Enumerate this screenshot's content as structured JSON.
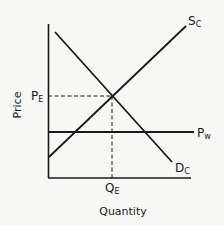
{
  "diagram": {
    "type": "supply-demand",
    "y_axis_label": "Price",
    "x_axis_label": "Quantity",
    "labels": {
      "supply": {
        "main": "S",
        "sub": "C"
      },
      "demand": {
        "main": "D",
        "sub": "C"
      },
      "world_price": {
        "main": "P",
        "sub": "w"
      },
      "eq_price": {
        "main": "P",
        "sub": "E"
      },
      "eq_quantity": {
        "main": "Q",
        "sub": "E"
      }
    },
    "colors": {
      "line": "#1a1a1a",
      "background": "#f7f7f5"
    }
  }
}
